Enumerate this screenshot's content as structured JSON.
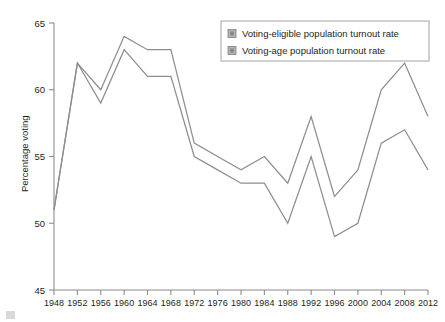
{
  "chart_data": {
    "type": "line",
    "title": "",
    "subtitle": "",
    "xlabel": "",
    "ylabel": "Percentage voting",
    "categories": [
      1948,
      1952,
      1956,
      1960,
      1964,
      1968,
      1972,
      1976,
      1980,
      1984,
      1988,
      1992,
      1996,
      2000,
      2004,
      2008,
      2012
    ],
    "x": [
      "1948",
      "1952",
      "1956",
      "1960",
      "1964",
      "1968",
      "1972",
      "1976",
      "1980",
      "1984",
      "1988",
      "1992",
      "1996",
      "2000",
      "2004",
      "2008",
      "2012"
    ],
    "xlim": [
      1948,
      2012
    ],
    "ylim": [
      45,
      65
    ],
    "yticks": [
      45,
      50,
      55,
      60,
      65
    ],
    "ytick_labels": [
      "45",
      "50",
      "55",
      "60",
      "65"
    ],
    "grid": false,
    "legend_position": "top-right",
    "series": [
      {
        "name": "Voting-eligible population turnout rate",
        "color": "#8e8e8e",
        "values": [
          51,
          62,
          60,
          64,
          63,
          63,
          56,
          55,
          54,
          55,
          53,
          58,
          52,
          54,
          60,
          62,
          58
        ]
      },
      {
        "name": "Voting-age population turnout rate",
        "color": "#8e8e8e",
        "values": [
          51,
          62,
          59,
          63,
          61,
          61,
          55,
          54,
          53,
          53,
          50,
          55,
          49,
          50,
          56,
          57,
          54
        ]
      }
    ]
  },
  "legend": {
    "items": [
      {
        "label": "Voting-eligible population turnout rate"
      },
      {
        "label": "Voting-age population turnout rate"
      }
    ]
  },
  "axes": {
    "y_title": "Percentage voting"
  }
}
